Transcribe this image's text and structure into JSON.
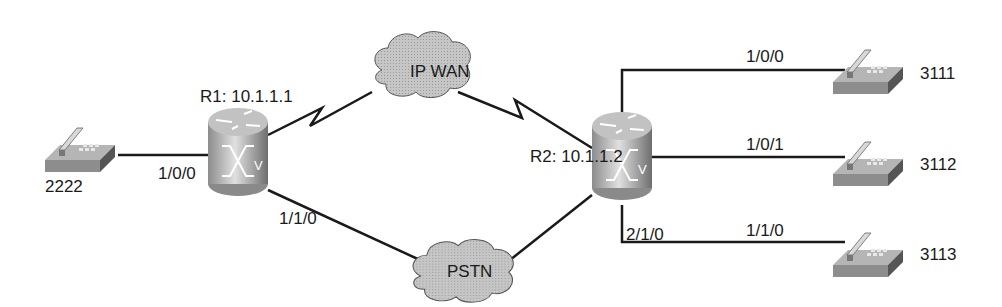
{
  "diagram": {
    "routers": [
      {
        "id": "R1",
        "label": "R1: 10.1.1.1"
      },
      {
        "id": "R2",
        "label": "R2: 10.1.1.2"
      }
    ],
    "clouds": [
      {
        "id": "ipwan",
        "label": "IP WAN"
      },
      {
        "id": "pstn",
        "label": "PSTN"
      }
    ],
    "phones": [
      {
        "id": "p2222",
        "number": "2222"
      },
      {
        "id": "p3111",
        "number": "3111"
      },
      {
        "id": "p3112",
        "number": "3112"
      },
      {
        "id": "p3113",
        "number": "3113"
      }
    ],
    "ports": {
      "r1_phone": "1/0/0",
      "r1_pstn": "1/1/0",
      "r2_pstn": "2/1/0",
      "r2_p3111": "1/0/0",
      "r2_p3112": "1/0/1",
      "r2_p3113": "1/1/0"
    },
    "router_glyph": "V",
    "colors": {
      "line": "#1a1a1a",
      "cloud": "#c8c8c8",
      "router": "#a8a8a8",
      "phone": "#9a9a9a"
    }
  }
}
